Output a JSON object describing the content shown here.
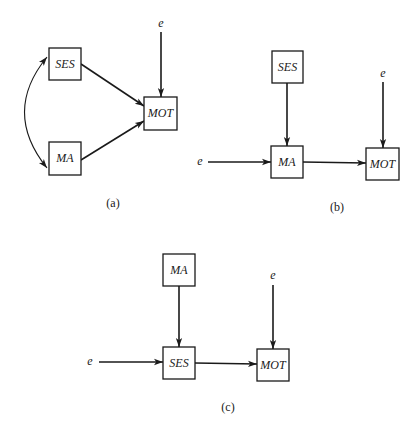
{
  "panels": {
    "a": {
      "caption": "(a)",
      "nodes": {
        "ses": "SES",
        "ma": "MA",
        "mot": "MOT"
      },
      "error_label": "e",
      "edges": [
        {
          "from": "SES",
          "to": "MOT",
          "type": "directed"
        },
        {
          "from": "MA",
          "to": "MOT",
          "type": "directed"
        },
        {
          "from": "SES",
          "to": "MA",
          "type": "bidirectional-curved"
        },
        {
          "from": "e",
          "to": "MOT",
          "type": "directed"
        }
      ]
    },
    "b": {
      "caption": "(b)",
      "nodes": {
        "ses": "SES",
        "ma": "MA",
        "mot": "MOT"
      },
      "error_label_ma": "e",
      "error_label_mot": "e",
      "edges": [
        {
          "from": "SES",
          "to": "MA",
          "type": "directed"
        },
        {
          "from": "e",
          "to": "MA",
          "type": "directed"
        },
        {
          "from": "MA",
          "to": "MOT",
          "type": "directed"
        },
        {
          "from": "e",
          "to": "MOT",
          "type": "directed"
        }
      ]
    },
    "c": {
      "caption": "(c)",
      "nodes": {
        "ma": "MA",
        "ses": "SES",
        "mot": "MOT"
      },
      "error_label_ses": "e",
      "error_label_mot": "e",
      "edges": [
        {
          "from": "MA",
          "to": "SES",
          "type": "directed"
        },
        {
          "from": "e",
          "to": "SES",
          "type": "directed"
        },
        {
          "from": "SES",
          "to": "MOT",
          "type": "directed"
        },
        {
          "from": "e",
          "to": "MOT",
          "type": "directed"
        }
      ]
    }
  }
}
